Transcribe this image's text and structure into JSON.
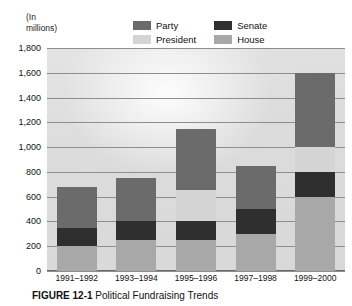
{
  "figure": {
    "axis_note": "(In\nmillions)",
    "caption_number": "FIGURE 12-1",
    "caption_text": "Political Fundraising Trends"
  },
  "legend": {
    "items": [
      {
        "label": "Party",
        "color": "#6b6b6b",
        "name": "legend-party"
      },
      {
        "label": "Senate",
        "color": "#2f2f2f",
        "name": "legend-senate"
      },
      {
        "label": "President",
        "color": "#d4d4d4",
        "name": "legend-president"
      },
      {
        "label": "House",
        "color": "#a8a8a8",
        "name": "legend-house"
      }
    ]
  },
  "chart_data": {
    "type": "bar",
    "subtype": "stacked-bar",
    "title": "Political Fundraising Trends",
    "xlabel": "",
    "ylabel": "(In millions)",
    "ylim": [
      0,
      1800
    ],
    "ytick_step": 200,
    "ytick_labels": [
      "1,800",
      "1,600",
      "1,400",
      "1,200",
      "1,000",
      "800",
      "600",
      "400",
      "200",
      "0"
    ],
    "ytick_values": [
      1800,
      1600,
      1400,
      1200,
      1000,
      800,
      600,
      400,
      200,
      0
    ],
    "grid": true,
    "legend_position": "top",
    "categories": [
      "1991–1992",
      "1993–1994",
      "1995–1996",
      "1997–1998",
      "1999–2000"
    ],
    "stack_order": [
      "House",
      "Senate",
      "President",
      "Party"
    ],
    "series": [
      {
        "name": "House",
        "color": "#a8a8a8",
        "values": [
          200,
          250,
          250,
          300,
          600
        ]
      },
      {
        "name": "Senate",
        "color": "#2f2f2f",
        "values": [
          150,
          150,
          150,
          200,
          200
        ]
      },
      {
        "name": "President",
        "color": "#d4d4d4",
        "values": [
          0,
          0,
          250,
          0,
          200
        ]
      },
      {
        "name": "Party",
        "color": "#6b6b6b",
        "values": [
          325,
          350,
          500,
          350,
          600
        ]
      }
    ],
    "totals": [
      675,
      750,
      1150,
      850,
      1600
    ]
  }
}
